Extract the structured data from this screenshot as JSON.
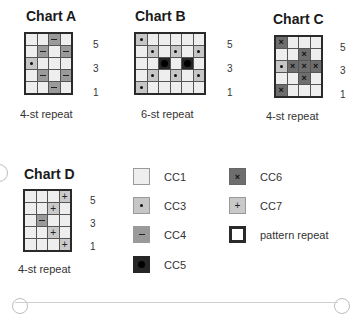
{
  "charts": [
    {
      "id": "A",
      "title": "Chart A",
      "repeat_label": "4-st repeat",
      "columns": 4,
      "row_numbers": [
        "5",
        "3",
        "1"
      ],
      "rows_top_to_bottom": [
        [
          "CC1",
          "CC1",
          "CC4",
          "CC1"
        ],
        [
          "CC1",
          "CC4",
          "CC1",
          "CC4"
        ],
        [
          "CC3",
          "CC1",
          "CC1",
          "CC1"
        ],
        [
          "CC1",
          "CC4",
          "CC1",
          "CC4"
        ],
        [
          "CC1",
          "CC1",
          "CC4",
          "CC1"
        ]
      ]
    },
    {
      "id": "B",
      "title": "Chart B",
      "repeat_label": "6-st repeat",
      "columns": 6,
      "row_numbers": [
        "5",
        "3",
        "1"
      ],
      "rows_top_to_bottom": [
        [
          "CC3",
          "CC1",
          "CC1",
          "CC1",
          "CC1",
          "CC1"
        ],
        [
          "CC1",
          "CC3",
          "CC1",
          "CC3",
          "CC1",
          "CC3"
        ],
        [
          "CC1",
          "CC1",
          "CC5",
          "CC1",
          "CC5",
          "CC1"
        ],
        [
          "CC1",
          "CC3",
          "CC1",
          "CC3",
          "CC1",
          "CC3"
        ],
        [
          "CC3",
          "CC1",
          "CC1",
          "CC1",
          "CC1",
          "CC1"
        ]
      ]
    },
    {
      "id": "C",
      "title": "Chart C",
      "repeat_label": "4-st repeat",
      "columns": 4,
      "row_numbers": [
        "5",
        "3",
        "1"
      ],
      "rows_top_to_bottom": [
        [
          "CC6",
          "CC1",
          "CC1",
          "CC1"
        ],
        [
          "CC1",
          "CC1",
          "CC6",
          "CC1"
        ],
        [
          "CC3",
          "CC6",
          "CC6",
          "CC6"
        ],
        [
          "CC1",
          "CC1",
          "CC6",
          "CC1"
        ],
        [
          "CC6",
          "CC1",
          "CC1",
          "CC1"
        ]
      ]
    },
    {
      "id": "D",
      "title": "Chart D",
      "repeat_label": "4-st repeat",
      "columns": 4,
      "row_numbers": [
        "5",
        "3",
        "1"
      ],
      "rows_top_to_bottom": [
        [
          "CC1",
          "CC1",
          "CC1",
          "CC7"
        ],
        [
          "CC1",
          "CC1",
          "CC7",
          "CC1"
        ],
        [
          "CC1",
          "CC4",
          "CC1",
          "CC1"
        ],
        [
          "CC1",
          "CC1",
          "CC7",
          "CC1"
        ],
        [
          "CC1",
          "CC1",
          "CC1",
          "CC7"
        ]
      ]
    }
  ],
  "legend": {
    "items": [
      {
        "key": "CC1",
        "label": "CC1",
        "symbol": "none",
        "color": "#eeeeee"
      },
      {
        "key": "CC3",
        "label": "CC3",
        "symbol": "dot",
        "color": "#c6c6c6"
      },
      {
        "key": "CC4",
        "label": "CC4",
        "symbol": "dash",
        "color": "#9a9a9a"
      },
      {
        "key": "CC5",
        "label": "CC5",
        "symbol": "big-dot",
        "color": "#262626"
      },
      {
        "key": "CC6",
        "label": "CC6",
        "symbol": "x",
        "color": "#6e6e6e"
      },
      {
        "key": "CC7",
        "label": "CC7",
        "symbol": "plus",
        "color": "#c9c9c9"
      },
      {
        "key": "repeat",
        "label": "pattern repeat",
        "symbol": "bold-outline",
        "color": "#ffffff"
      }
    ]
  },
  "symbols": {
    "CC6": "×",
    "CC7": "+"
  }
}
